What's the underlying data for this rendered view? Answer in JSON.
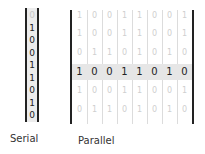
{
  "serial": {
    "label": "Serial",
    "bits": [
      {
        "value": "0",
        "faded": true
      },
      {
        "value": "1",
        "faded": false
      },
      {
        "value": "0",
        "faded": false
      },
      {
        "value": "0",
        "faded": false
      },
      {
        "value": "1",
        "faded": false
      },
      {
        "value": "1",
        "faded": false
      },
      {
        "value": "0",
        "faded": false
      },
      {
        "value": "1",
        "faded": false
      },
      {
        "value": "0",
        "faded": false
      }
    ]
  },
  "parallel": {
    "label": "Parallel",
    "active_row": 3,
    "rows": [
      [
        "1",
        "0",
        "0",
        "1",
        "1",
        "0",
        "0",
        "1"
      ],
      [
        "1",
        "0",
        "0",
        "1",
        "1",
        "0",
        "0",
        "1"
      ],
      [
        "0",
        "1",
        "1",
        "0",
        "1",
        "0",
        "1",
        "0"
      ],
      [
        "1",
        "0",
        "0",
        "1",
        "1",
        "0",
        "1",
        "0"
      ],
      [
        "1",
        "0",
        "0",
        "1",
        "1",
        "0",
        "0",
        "1"
      ],
      [
        "0",
        "1",
        "1",
        "0",
        "1",
        "0",
        "1",
        "0"
      ]
    ]
  },
  "colors": {
    "border": "#222222",
    "highlight": "#e6e6e6",
    "faded_text": "#cfcfcf"
  }
}
